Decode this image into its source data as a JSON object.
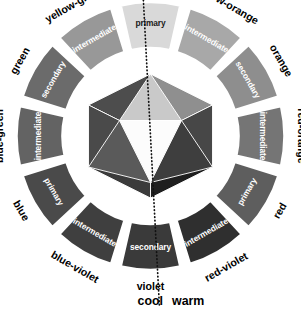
{
  "diagram": {
    "center": {
      "x": 150.5,
      "y": 136
    },
    "inner_radius": 88,
    "outer_radius": 134,
    "hex_radius": 62,
    "gap_degrees": 4.2,
    "temperature": {
      "cool_label": "cool",
      "warm_label": "warm",
      "divider_style": "dotted"
    },
    "colors": {
      "background": "#ffffff",
      "outline": "#ffffff",
      "text_light": "#ffffff",
      "text_dark": "#1a1a1a",
      "label_text": "#000000",
      "divider": "#111111"
    },
    "segments": [
      {
        "name": "yellow",
        "role": "primary",
        "angle": 0,
        "fill": "#d9d9d9",
        "label_dark": true,
        "outer_label_r": 150,
        "outer_label_rot": 0
      },
      {
        "name": "yellow-orange",
        "role": "intermediate",
        "angle": 30,
        "fill": "#a8a8a8",
        "label_dark": false,
        "outer_label_r": 152,
        "outer_label_rot": 30
      },
      {
        "name": "orange",
        "role": "secondary",
        "angle": 60,
        "fill": "#8e8e8e",
        "label_dark": false,
        "outer_label_r": 150,
        "outer_label_rot": 60
      },
      {
        "name": "red-orange",
        "role": "intermediate",
        "angle": 90,
        "fill": "#757575",
        "label_dark": false,
        "outer_label_r": 150,
        "outer_label_rot": 90
      },
      {
        "name": "red",
        "role": "primary",
        "angle": 120,
        "fill": "#5e5e5e",
        "label_dark": false,
        "outer_label_r": 150,
        "outer_label_rot": 120
      },
      {
        "name": "red-violet",
        "role": "intermediate",
        "angle": 150,
        "fill": "#2f2f2f",
        "label_dark": false,
        "outer_label_r": 152,
        "outer_label_rot": 150
      },
      {
        "name": "violet",
        "role": "secondary",
        "angle": 180,
        "fill": "#3a3a3a",
        "label_dark": false,
        "outer_label_r": 151,
        "outer_label_rot": 180
      },
      {
        "name": "blue-violet",
        "role": "intermediate",
        "angle": 210,
        "fill": "#3f3f3f",
        "label_dark": false,
        "outer_label_r": 152,
        "outer_label_rot": 210
      },
      {
        "name": "blue",
        "role": "primary",
        "angle": 240,
        "fill": "#4a4a4a",
        "label_dark": false,
        "outer_label_r": 150,
        "outer_label_rot": 240
      },
      {
        "name": "blue-green",
        "role": "intermediate",
        "angle": 270,
        "fill": "#636363",
        "label_dark": false,
        "outer_label_r": 150,
        "outer_label_rot": 270
      },
      {
        "name": "green",
        "role": "secondary",
        "angle": 300,
        "fill": "#6b6b6b",
        "label_dark": false,
        "outer_label_r": 150,
        "outer_label_rot": 300
      },
      {
        "name": "yellow-green",
        "role": "intermediate",
        "angle": 330,
        "fill": "#989898",
        "label_dark": false,
        "outer_label_r": 152,
        "outer_label_rot": 330
      }
    ],
    "hexagon_facets": [
      {
        "id": "upper-left-outer",
        "fill": "#4d4d4d",
        "points": "-62,-31 0,-62 0,0"
      },
      {
        "id": "upper-right-outer",
        "fill": "#8f8f8f",
        "points": "0,-62 62,-31 0,0"
      },
      {
        "id": "left-outer",
        "fill": "#4a4a4a",
        "points": "-62,-31 0,0 -62,31"
      },
      {
        "id": "right-outer",
        "fill": "#474747",
        "points": "62,-31 62,31 0,0"
      },
      {
        "id": "lower-left-outer",
        "fill": "#3b3b3b",
        "points": "-62,31 0,0 0,62"
      },
      {
        "id": "lower-right-outer",
        "fill": "#1f1f1f",
        "points": "0,0 62,31 0,62"
      },
      {
        "id": "inner-top",
        "fill": "#c9c9c9",
        "points": "-31,-15.5 0,-62 31,-15.5"
      },
      {
        "id": "inner-center-white",
        "fill": "#fcfcfc",
        "points": "-31,-15.5 31,-15.5 0,46.5"
      },
      {
        "id": "inner-left",
        "fill": "#5a5a5a",
        "points": "-62,31 -31,-15.5 0,46.5"
      },
      {
        "id": "inner-right",
        "fill": "#3e3e3e",
        "points": "31,-15.5 62,31 0,46.5"
      }
    ]
  }
}
